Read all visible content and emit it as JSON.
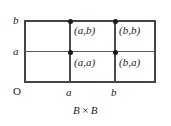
{
  "figure": {
    "caption_left": "B",
    "caption_symbol": "×",
    "caption_right": "B",
    "origin_label": "O",
    "x_axis": {
      "ticks": [
        {
          "label": "a",
          "value": 70
        },
        {
          "label": "b",
          "value": 115
        }
      ]
    },
    "y_axis": {
      "ticks": [
        {
          "label": "a",
          "value": 52
        },
        {
          "label": "b",
          "value": 20
        }
      ]
    },
    "points": [
      {
        "name": "point-a-b",
        "label": "(a,b)",
        "x": "a",
        "y": "b"
      },
      {
        "name": "point-b-b",
        "label": "(b,b)",
        "x": "b",
        "y": "b"
      },
      {
        "name": "point-a-a",
        "label": "(a,a)",
        "x": "a",
        "y": "a"
      },
      {
        "name": "point-b-a",
        "label": "(b,a)",
        "x": "b",
        "y": "a"
      }
    ],
    "colors": {
      "stroke": "#444444",
      "grid": "#5a5a5a",
      "point": "#1a1a1a",
      "text": "#1c1c1c",
      "background": "#ffffff"
    }
  },
  "chart_data": {
    "type": "scatter",
    "xlabel": "",
    "ylabel": "",
    "x_ticklabels": [
      "O",
      "a",
      "b"
    ],
    "y_ticklabels": [
      "a",
      "b"
    ],
    "grid": true,
    "legend": "none",
    "points": [
      {
        "label": "(a,b)",
        "x": "a",
        "y": "b"
      },
      {
        "label": "(b,b)",
        "x": "b",
        "y": "b"
      },
      {
        "label": "(a,a)",
        "x": "a",
        "y": "a"
      },
      {
        "label": "(b,a)",
        "x": "b",
        "y": "a"
      }
    ]
  }
}
